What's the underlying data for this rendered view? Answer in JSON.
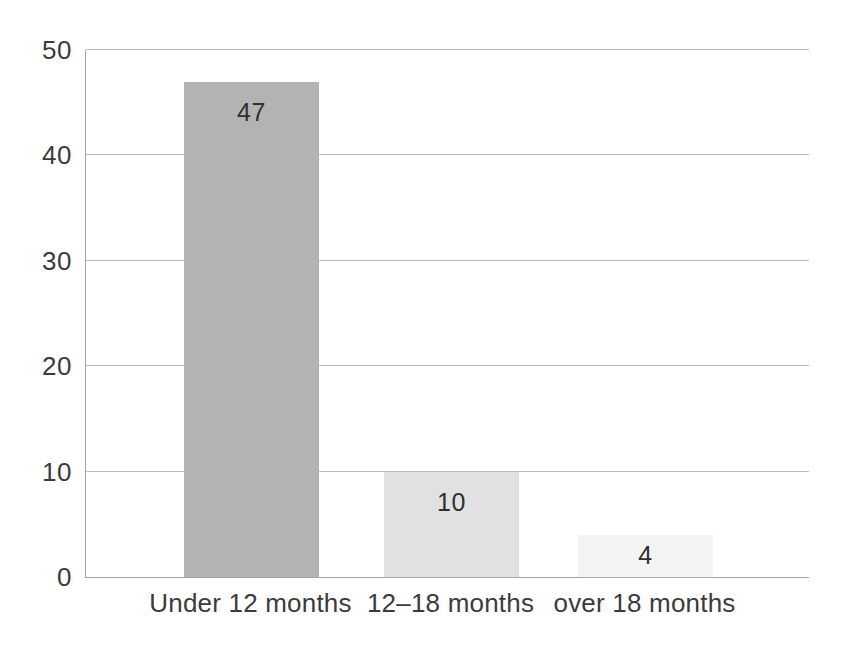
{
  "chart_data": {
    "type": "bar",
    "categories": [
      "Under 12 months",
      "12–18 months",
      "over 18 months"
    ],
    "values": [
      47,
      10,
      4
    ],
    "data_labels": [
      "47",
      "10",
      "4"
    ],
    "title": "",
    "xlabel": "",
    "ylabel": "",
    "ylim": [
      0,
      50
    ],
    "yticks": [
      0,
      10,
      20,
      30,
      40,
      50
    ],
    "grid": true,
    "legend": false,
    "bar_colors": [
      "#b3b3b3",
      "#e1e1e1",
      "#f4f4f4"
    ],
    "grid_color": "#bcbcbc",
    "axis_color": "#a6a6a6",
    "text_color": "#3b3b3b",
    "background_color": "#ffffff",
    "layout": {
      "plot_left_px": 85,
      "plot_top_px": 50,
      "plot_width_px": 723,
      "plot_height_px": 527,
      "bar_width_px": 135,
      "bar_lefts_px": [
        98,
        298,
        492
      ],
      "value_label_offset_px": 18
    }
  }
}
